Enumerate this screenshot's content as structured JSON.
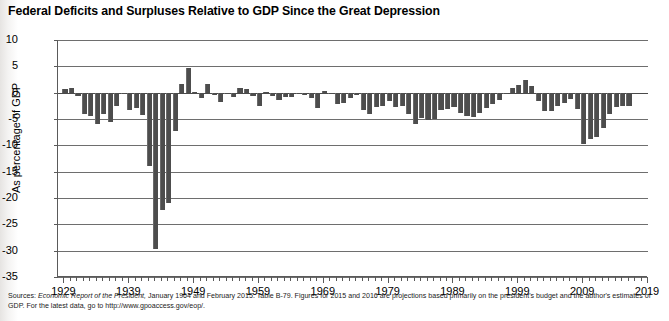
{
  "title": "Federal Deficits and Surpluses Relative to GDP Since the Great Depression",
  "source": {
    "lead": "Sources:",
    "italic": "Economic Report of the President,",
    "rest": " January 1964 and February 2015. Table B-79. Figures for 2015 and 2016 are projections based primarily on the president's budget and the author's estimates of GDP. For the latest data, go to http://www.gpoaccess.gov/eop/."
  },
  "chart_data": {
    "type": "bar",
    "title": "Federal Deficits and Surpluses Relative to GDP Since the Great Depression",
    "xlabel": "",
    "ylabel": "As percentage of GDP",
    "ylim": [
      -35,
      10
    ],
    "xlim": [
      1928,
      2019
    ],
    "grid": true,
    "legend": null,
    "bar_color": "#4d4d4d",
    "ytick_labels": [
      "10",
      "5",
      "0",
      "-5",
      "-10",
      "-15",
      "-20",
      "-25",
      "-30",
      "-35"
    ],
    "ytick_values": [
      10,
      5,
      0,
      -5,
      -10,
      -15,
      -20,
      -25,
      -30,
      -35
    ],
    "xtick_labels": [
      "1929",
      "1939",
      "1949",
      "1959",
      "1969",
      "1979",
      "1989",
      "1999",
      "2009",
      "2019"
    ],
    "xtick_values": [
      1929,
      1939,
      1949,
      1959,
      1969,
      1979,
      1989,
      1999,
      2009,
      2019
    ],
    "series_name": "Federal surplus/deficit as percentage of GDP",
    "x": [
      1929,
      1930,
      1931,
      1932,
      1933,
      1934,
      1935,
      1936,
      1937,
      1938,
      1939,
      1940,
      1941,
      1942,
      1943,
      1944,
      1945,
      1946,
      1947,
      1948,
      1949,
      1950,
      1951,
      1952,
      1953,
      1954,
      1955,
      1956,
      1957,
      1958,
      1959,
      1960,
      1961,
      1962,
      1963,
      1964,
      1965,
      1966,
      1967,
      1968,
      1969,
      1970,
      1971,
      1972,
      1973,
      1974,
      1975,
      1976,
      1977,
      1978,
      1979,
      1980,
      1981,
      1982,
      1983,
      1984,
      1985,
      1986,
      1987,
      1988,
      1989,
      1990,
      1991,
      1992,
      1993,
      1994,
      1995,
      1996,
      1997,
      1998,
      1999,
      2000,
      2001,
      2002,
      2003,
      2004,
      2005,
      2006,
      2007,
      2008,
      2009,
      2010,
      2011,
      2012,
      2013,
      2014,
      2015,
      2016
    ],
    "values": [
      0.7,
      0.8,
      -0.6,
      -4.0,
      -4.5,
      -5.9,
      -4.0,
      -5.5,
      -2.5,
      -0.1,
      -3.2,
      -3.0,
      -4.3,
      -13.9,
      -29.6,
      -22.2,
      -21.0,
      -7.2,
      1.7,
      4.6,
      0.2,
      -1.1,
      1.6,
      -0.4,
      -1.7,
      -0.3,
      -0.8,
      0.9,
      0.7,
      -0.6,
      -2.6,
      0.1,
      -0.6,
      -1.3,
      -0.8,
      -0.9,
      -0.2,
      -0.5,
      -1.1,
      -2.9,
      0.3,
      -0.3,
      -2.1,
      -1.9,
      -1.1,
      -0.4,
      -3.3,
      -4.1,
      -2.7,
      -2.6,
      -1.6,
      -2.7,
      -2.6,
      -4.0,
      -6.0,
      -4.8,
      -5.1,
      -5.0,
      -3.2,
      -3.1,
      -2.8,
      -3.9,
      -4.5,
      -4.7,
      -3.9,
      -2.9,
      -2.2,
      -1.4,
      -0.3,
      0.8,
      1.4,
      2.4,
      1.3,
      -1.5,
      -3.4,
      -3.5,
      -2.6,
      -1.9,
      -1.2,
      -3.1,
      -9.8,
      -8.8,
      -8.4,
      -6.8,
      -4.1,
      -2.8,
      -2.5,
      -2.6
    ]
  }
}
